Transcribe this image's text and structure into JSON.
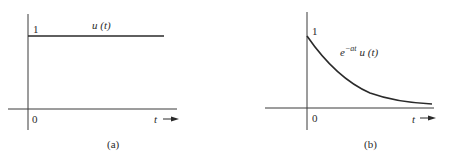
{
  "panels": [
    {
      "id": "a",
      "caption": "(a)",
      "y_tick_label": "1",
      "origin_label": "0",
      "x_axis_label": "t",
      "curve_label": "u (t)",
      "function": "unit step"
    },
    {
      "id": "b",
      "caption": "(b)",
      "y_tick_label": "1",
      "origin_label": "0",
      "x_axis_label": "t",
      "curve_label_base": "e",
      "curve_label_exp": "−at",
      "curve_label_rest": "u (t)",
      "function": "decaying exponential"
    }
  ],
  "colors": {
    "axis": "#3a3a3a",
    "curve": "#2a2a2a",
    "text": "#2a2a2a"
  }
}
